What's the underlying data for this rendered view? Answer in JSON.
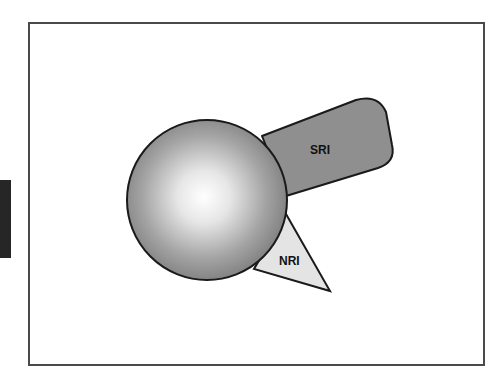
{
  "diagram": {
    "shapes": [
      {
        "id": "sphere",
        "type": "circle",
        "label": ""
      },
      {
        "id": "sri",
        "type": "rounded-rectangle",
        "label": "SRI",
        "fill": "#8f8f8f"
      },
      {
        "id": "nri",
        "type": "triangle",
        "label": "NRI",
        "fill": "#e4e4e4"
      }
    ],
    "colors": {
      "outline": "#1a1a1a",
      "sphere_center": "#ffffff",
      "sphere_edge": "#7d7d7d",
      "frame_border": "#4a4a4a",
      "side_tab": "#262626"
    }
  }
}
